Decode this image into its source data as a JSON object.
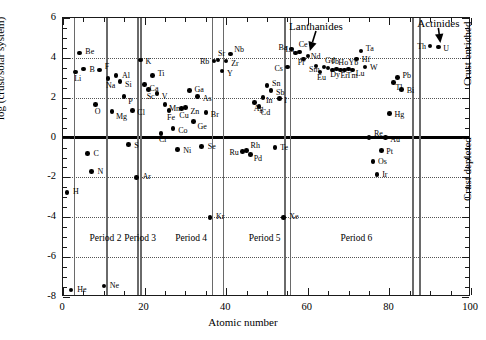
{
  "chart_data": {
    "type": "scatter",
    "title": "",
    "xlabel": "Atomic number",
    "ylabel": "log (crust/solar system)",
    "xlim": [
      0,
      100
    ],
    "ylim": [
      -8,
      6
    ],
    "xticks": [
      0,
      20,
      40,
      60,
      80,
      100
    ],
    "yticks": [
      -8,
      -6,
      -4,
      -2,
      0,
      2,
      4,
      6
    ],
    "xminor_step": 5,
    "yminor_step": 0.5,
    "grid": "horizontal dotted at major y ticks",
    "legend": "none",
    "zero_reference_line": 0,
    "annotations": [
      {
        "text": "Lanthanides",
        "x": 62,
        "y": 5.55,
        "arrow_to_x": 60.5,
        "arrow_to_y": 4.35
      },
      {
        "text": "Actinides",
        "x": 92,
        "y": 5.7,
        "arrow_to_x": 92.5,
        "arrow_to_y": 4.75
      },
      {
        "text": "Crust enriched",
        "x": 97.5,
        "y": 2.6,
        "rotation": -90
      },
      {
        "text": "Crust depleted",
        "x": 97.5,
        "y": -3.2,
        "rotation": -90
      },
      {
        "text": "Period 2",
        "x": 6.5,
        "y": -5.1
      },
      {
        "text": "Period 3",
        "x": 15.0,
        "y": -5.1
      },
      {
        "text": "Period 4",
        "x": 27.5,
        "y": -5.1
      },
      {
        "text": "Period 5",
        "x": 45.5,
        "y": -5.1
      },
      {
        "text": "Period 6",
        "x": 68.0,
        "y": -5.1
      }
    ],
    "period_dividers": [
      2.6,
      10.6,
      18.2,
      18.9,
      36.4,
      39.2,
      54.2,
      55.6,
      85.6,
      87.3
    ],
    "points": [
      {
        "el": "H",
        "z": 1,
        "v": -2.75,
        "lx": 6,
        "ly": 0
      },
      {
        "el": "He",
        "z": 2,
        "v": -7.65,
        "lx": 6,
        "ly": 0
      },
      {
        "el": "Li",
        "z": 3,
        "v": 3.3,
        "lx": -1,
        "ly": 7
      },
      {
        "el": "Be",
        "z": 4,
        "v": 4.25,
        "lx": 6,
        "ly": -1
      },
      {
        "el": "B",
        "z": 5,
        "v": 3.45,
        "lx": 6,
        "ly": 1
      },
      {
        "el": "C",
        "z": 6,
        "v": -0.8,
        "lx": 6,
        "ly": 0
      },
      {
        "el": "N",
        "z": 7,
        "v": -1.7,
        "lx": 6,
        "ly": 1
      },
      {
        "el": "O",
        "z": 8,
        "v": 1.65,
        "lx": -1,
        "ly": 7
      },
      {
        "el": "F",
        "z": 9,
        "v": 3.4,
        "lx": 5,
        "ly": -3
      },
      {
        "el": "Ne",
        "z": 10,
        "v": -7.45,
        "lx": 6,
        "ly": 0
      },
      {
        "el": "Na",
        "z": 11,
        "v": 2.95,
        "lx": -2,
        "ly": 7
      },
      {
        "el": "Mg",
        "z": 12,
        "v": 1.3,
        "lx": 4,
        "ly": 5
      },
      {
        "el": "Al",
        "z": 13,
        "v": 3.1,
        "lx": 6,
        "ly": 0
      },
      {
        "el": "Si",
        "z": 14,
        "v": 2.8,
        "lx": 5,
        "ly": 3
      },
      {
        "el": "P",
        "z": 15,
        "v": 2.05,
        "lx": 4,
        "ly": 5
      },
      {
        "el": "S",
        "z": 16,
        "v": -0.35,
        "lx": 6,
        "ly": 1
      },
      {
        "el": "Cl",
        "z": 17,
        "v": 1.35,
        "lx": 5,
        "ly": 2
      },
      {
        "el": "Ar",
        "z": 18,
        "v": -2.0,
        "lx": 6,
        "ly": 0
      },
      {
        "el": "K",
        "z": 19,
        "v": 3.9,
        "lx": 5,
        "ly": 2
      },
      {
        "el": "Ca",
        "z": 20,
        "v": 2.65,
        "lx": 5,
        "ly": 4
      },
      {
        "el": "Sc",
        "z": 21,
        "v": 2.4,
        "lx": -2,
        "ly": 7
      },
      {
        "el": "Ti",
        "z": 22,
        "v": 3.1,
        "lx": 5,
        "ly": -2
      },
      {
        "el": "V",
        "z": 23,
        "v": 2.2,
        "lx": 5,
        "ly": 3
      },
      {
        "el": "Cr",
        "z": 24,
        "v": 0.2,
        "lx": -2,
        "ly": 6
      },
      {
        "el": "Mn",
        "z": 25,
        "v": 1.65,
        "lx": 4,
        "ly": 4
      },
      {
        "el": "Fe",
        "z": 26,
        "v": 1.35,
        "lx": -2,
        "ly": 7
      },
      {
        "el": "Co",
        "z": 27,
        "v": 0.45,
        "lx": 5,
        "ly": 2
      },
      {
        "el": "Ni",
        "z": 28,
        "v": -0.6,
        "lx": 6,
        "ly": 1
      },
      {
        "el": "Cu",
        "z": 29,
        "v": 1.45,
        "lx": -2,
        "ly": 7
      },
      {
        "el": "Zn",
        "z": 30,
        "v": 1.5,
        "lx": 5,
        "ly": 4
      },
      {
        "el": "Ga",
        "z": 31,
        "v": 2.35,
        "lx": 5,
        "ly": -1
      },
      {
        "el": "Ge",
        "z": 32,
        "v": 0.8,
        "lx": 4,
        "ly": 5
      },
      {
        "el": "As",
        "z": 33,
        "v": 2.05,
        "lx": 5,
        "ly": 2
      },
      {
        "el": "Se",
        "z": 34,
        "v": -0.45,
        "lx": 6,
        "ly": 0
      },
      {
        "el": "Br",
        "z": 35,
        "v": 1.25,
        "lx": 5,
        "ly": 2
      },
      {
        "el": "Kr",
        "z": 36,
        "v": -4.0,
        "lx": 6,
        "ly": 0
      },
      {
        "el": "Rb",
        "z": 37,
        "v": 3.85,
        "lx": -14,
        "ly": 1
      },
      {
        "el": "Sr",
        "z": 38,
        "v": 3.9,
        "lx": 0,
        "ly": -6
      },
      {
        "el": "Y",
        "z": 39,
        "v": 3.35,
        "lx": 5,
        "ly": 3
      },
      {
        "el": "Zr",
        "z": 40,
        "v": 3.85,
        "lx": 5,
        "ly": 3
      },
      {
        "el": "Nb",
        "z": 41,
        "v": 4.2,
        "lx": 4,
        "ly": -4
      },
      {
        "el": "Ru",
        "z": 44,
        "v": -0.7,
        "lx": -13,
        "ly": 1
      },
      {
        "el": "Rh",
        "z": 45,
        "v": -0.65,
        "lx": 4,
        "ly": -5
      },
      {
        "el": "Pd",
        "z": 46,
        "v": -0.85,
        "lx": 3,
        "ly": 4
      },
      {
        "el": "Ag",
        "z": 47,
        "v": 1.75,
        "lx": -1,
        "ly": 6
      },
      {
        "el": "Cd",
        "z": 48,
        "v": 1.55,
        "lx": 2,
        "ly": 6
      },
      {
        "el": "In",
        "z": 49,
        "v": 2.0,
        "lx": 3,
        "ly": 3
      },
      {
        "el": "Sn",
        "z": 50,
        "v": 2.6,
        "lx": 5,
        "ly": -2
      },
      {
        "el": "Sb",
        "z": 51,
        "v": 2.35,
        "lx": 5,
        "ly": 2
      },
      {
        "el": "Te",
        "z": 52,
        "v": -0.5,
        "lx": 5,
        "ly": 0
      },
      {
        "el": "I",
        "z": 53,
        "v": 1.95,
        "lx": 5,
        "ly": 2
      },
      {
        "el": "Xe",
        "z": 54,
        "v": -4.0,
        "lx": 6,
        "ly": 0
      },
      {
        "el": "Cs",
        "z": 55,
        "v": 3.55,
        "lx": -13,
        "ly": 2
      },
      {
        "el": "Ba",
        "z": 56,
        "v": 4.45,
        "lx": -13,
        "ly": -1
      },
      {
        "el": "La",
        "z": 57,
        "v": 4.25,
        "lx": -10,
        "ly": -3
      },
      {
        "el": "Ce",
        "z": 58,
        "v": 4.3,
        "lx": -1,
        "ly": -7
      },
      {
        "el": "Pr",
        "z": 59,
        "v": 3.95,
        "lx": -6,
        "ly": 4
      },
      {
        "el": "Nd",
        "z": 60,
        "v": 4.1,
        "lx": 3,
        "ly": 1
      },
      {
        "el": "Sm",
        "z": 62,
        "v": 3.6,
        "lx": -7,
        "ly": 4
      },
      {
        "el": "Eu",
        "z": 63,
        "v": 3.3,
        "lx": -3,
        "ly": 6
      },
      {
        "el": "Gd",
        "z": 64,
        "v": 3.55,
        "lx": 1,
        "ly": -6
      },
      {
        "el": "Tb",
        "z": 65,
        "v": 3.5,
        "lx": 2,
        "ly": -6
      },
      {
        "el": "Dy",
        "z": 66,
        "v": 3.4,
        "lx": -2,
        "ly": 5
      },
      {
        "el": "Ho",
        "z": 67,
        "v": 3.45,
        "lx": 2,
        "ly": -6
      },
      {
        "el": "Er",
        "z": 68,
        "v": 3.4,
        "lx": 0,
        "ly": 6
      },
      {
        "el": "Yb",
        "z": 70,
        "v": 3.45,
        "lx": 0,
        "ly": -6
      },
      {
        "el": "Tm",
        "z": 69,
        "v": 3.4,
        "lx": 2,
        "ly": 6
      },
      {
        "el": "Lu",
        "z": 71,
        "v": 3.4,
        "lx": 3,
        "ly": 4
      },
      {
        "el": "Hf",
        "z": 72,
        "v": 3.95,
        "lx": 5,
        "ly": 1
      },
      {
        "el": "Ta",
        "z": 73,
        "v": 4.35,
        "lx": 5,
        "ly": -2
      },
      {
        "el": "W",
        "z": 74,
        "v": 3.55,
        "lx": 5,
        "ly": 1
      },
      {
        "el": "Re",
        "z": 75,
        "v": 0.0,
        "lx": 5,
        "ly": -4
      },
      {
        "el": "Os",
        "z": 76,
        "v": -1.2,
        "lx": 5,
        "ly": 1
      },
      {
        "el": "Ir",
        "z": 77,
        "v": -1.85,
        "lx": 5,
        "ly": 1
      },
      {
        "el": "Pt",
        "z": 78,
        "v": -0.65,
        "lx": 5,
        "ly": 1
      },
      {
        "el": "Au",
        "z": 79,
        "v": 0.0,
        "lx": 5,
        "ly": 2
      },
      {
        "el": "Hg",
        "z": 80,
        "v": 1.2,
        "lx": 5,
        "ly": 1
      },
      {
        "el": "Tl",
        "z": 81,
        "v": 2.75,
        "lx": 2,
        "ly": 5
      },
      {
        "el": "Pb",
        "z": 82,
        "v": 3.0,
        "lx": 5,
        "ly": -2
      },
      {
        "el": "Bi",
        "z": 83,
        "v": 2.4,
        "lx": 5,
        "ly": 1
      },
      {
        "el": "Th",
        "z": 90,
        "v": 4.6,
        "lx": -13,
        "ly": 1
      },
      {
        "el": "U",
        "z": 92,
        "v": 4.55,
        "lx": 5,
        "ly": 2
      }
    ]
  }
}
